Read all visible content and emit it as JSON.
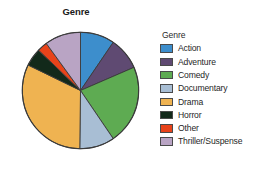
{
  "chart_data": {
    "type": "pie",
    "title": "Genre",
    "xlabel": "",
    "ylabel": "",
    "legend_position": "right",
    "legend_title": "Genre",
    "grid": false,
    "categories": [
      "Action",
      "Adventure",
      "Comedy",
      "Documentary",
      "Drama",
      "Horror",
      "Other",
      "Thriller/Suspense"
    ],
    "values": [
      9.5,
      9.0,
      22.0,
      9.7,
      32.0,
      5.0,
      2.8,
      10.0
    ],
    "value_unit": "percent",
    "colors": [
      "#3d8ecc",
      "#5f4a72",
      "#5eab52",
      "#a8bed4",
      "#efb351",
      "#12291a",
      "#e8431a",
      "#b9a4c4"
    ],
    "slices": [
      {
        "label": "Action",
        "percent": 9.5,
        "degrees": 34,
        "color": "#3d8ecc"
      },
      {
        "label": "Adventure",
        "percent": 9.0,
        "degrees": 32,
        "color": "#5f4a72"
      },
      {
        "label": "Comedy",
        "percent": 22.0,
        "degrees": 79,
        "color": "#5eab52"
      },
      {
        "label": "Documentary",
        "percent": 9.7,
        "degrees": 35,
        "color": "#a8bed4"
      },
      {
        "label": "Drama",
        "percent": 32.0,
        "degrees": 115,
        "color": "#efb351"
      },
      {
        "label": "Horror",
        "percent": 5.0,
        "degrees": 18,
        "color": "#12291a"
      },
      {
        "label": "Other",
        "percent": 2.8,
        "degrees": 10,
        "color": "#e8431a"
      },
      {
        "label": "Thriller/Suspense",
        "percent": 10.0,
        "degrees": 37,
        "color": "#b9a4c4"
      }
    ]
  },
  "legend": {
    "title": "Genre",
    "items": [
      {
        "label": "Action",
        "color": "#3d8ecc"
      },
      {
        "label": "Adventure",
        "color": "#5f4a72"
      },
      {
        "label": "Comedy",
        "color": "#5eab52"
      },
      {
        "label": "Documentary",
        "color": "#a8bed4"
      },
      {
        "label": "Drama",
        "color": "#efb351"
      },
      {
        "label": "Horror",
        "color": "#12291a"
      },
      {
        "label": "Other",
        "color": "#e8431a"
      },
      {
        "label": "Thriller/Suspense",
        "color": "#b9a4c4"
      }
    ]
  }
}
